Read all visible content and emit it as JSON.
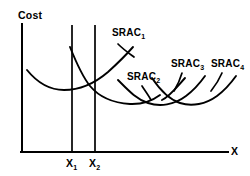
{
  "figure": {
    "type": "economics-cost-curve-diagram",
    "axes": {
      "y_label": "Cost",
      "x_label": "X",
      "x_axis_y": 152,
      "y_axis_x": 22,
      "x_axis_start": 22,
      "x_axis_end": 228,
      "y_axis_top": 24,
      "line_color": "#000000",
      "line_width": 2.0
    },
    "ticks": [
      {
        "name": "x1",
        "label": "X",
        "subscript": "1",
        "x": 72
      },
      {
        "name": "x2",
        "label": "X",
        "subscript": "2",
        "x": 95
      }
    ],
    "vertical_lines": [
      {
        "name": "x1-vertical-line",
        "x": 72,
        "y_top": 25,
        "y_bottom": 152
      },
      {
        "name": "x2-vertical-line",
        "x": 95,
        "y_top": 25,
        "y_bottom": 152
      }
    ],
    "curves": [
      {
        "name": "srac-curve-0",
        "label": "",
        "subscript": "",
        "path": "M 27 70 C 40 86, 52 90, 64 90 C 78 90, 94 84, 108 72 C 118 63, 126 55, 133 47"
      },
      {
        "name": "srac-curve-1",
        "label": "SRAC",
        "subscript": "1",
        "path": "M 70 47 C 76 62, 82 76, 90 86 C 100 98, 114 103, 130 104 C 142 104.5, 152 101, 160 95"
      },
      {
        "name": "srac-curve-2",
        "label": "SRAC",
        "subscript": "2",
        "path": "M 118 80 C 128 90, 136 99, 148 103 C 160 107, 174 105, 186 96 C 194 90, 200 83, 205 76"
      },
      {
        "name": "srac-curve-3",
        "label": "SRAC",
        "subscript": "3",
        "path": "M 152 78 C 160 90, 168 99, 180 103 C 192 107, 206 104, 217 96 C 225 90, 231 83, 236 76"
      },
      {
        "name": "srac-curve-4",
        "label": "SRAC",
        "subscript": "4",
        "path": "M 185 78 C 176 88, 170 96, 162 100"
      }
    ],
    "curve_labels": [
      {
        "name": "srac1-label",
        "text": "SRAC",
        "subscript": "1",
        "x": 112,
        "y": 28
      },
      {
        "name": "srac2-label",
        "text": "SRAC",
        "subscript": "2",
        "x": 127,
        "y": 72
      },
      {
        "name": "srac3-label",
        "text": "SRAC",
        "subscript": "3",
        "x": 171,
        "y": 59
      },
      {
        "name": "srac4-label",
        "text": "SRAC",
        "subscript": "4",
        "x": 211,
        "y": 59
      }
    ],
    "leaders": [
      {
        "name": "srac1-leader",
        "path": "M 118 44 C 124 50, 130 54, 134 57"
      },
      {
        "name": "srac2-leader",
        "path": "M 142 86 C 146 92, 149 96, 151 100"
      },
      {
        "name": "srac3-leader",
        "path": "M 182 73 C 180 80, 177 86, 174 91"
      },
      {
        "name": "srac4-leader",
        "path": "M 222 73 C 219 80, 215 86, 211 91"
      }
    ],
    "colors": {
      "background": "#ffffff",
      "ink": "#000000"
    }
  }
}
